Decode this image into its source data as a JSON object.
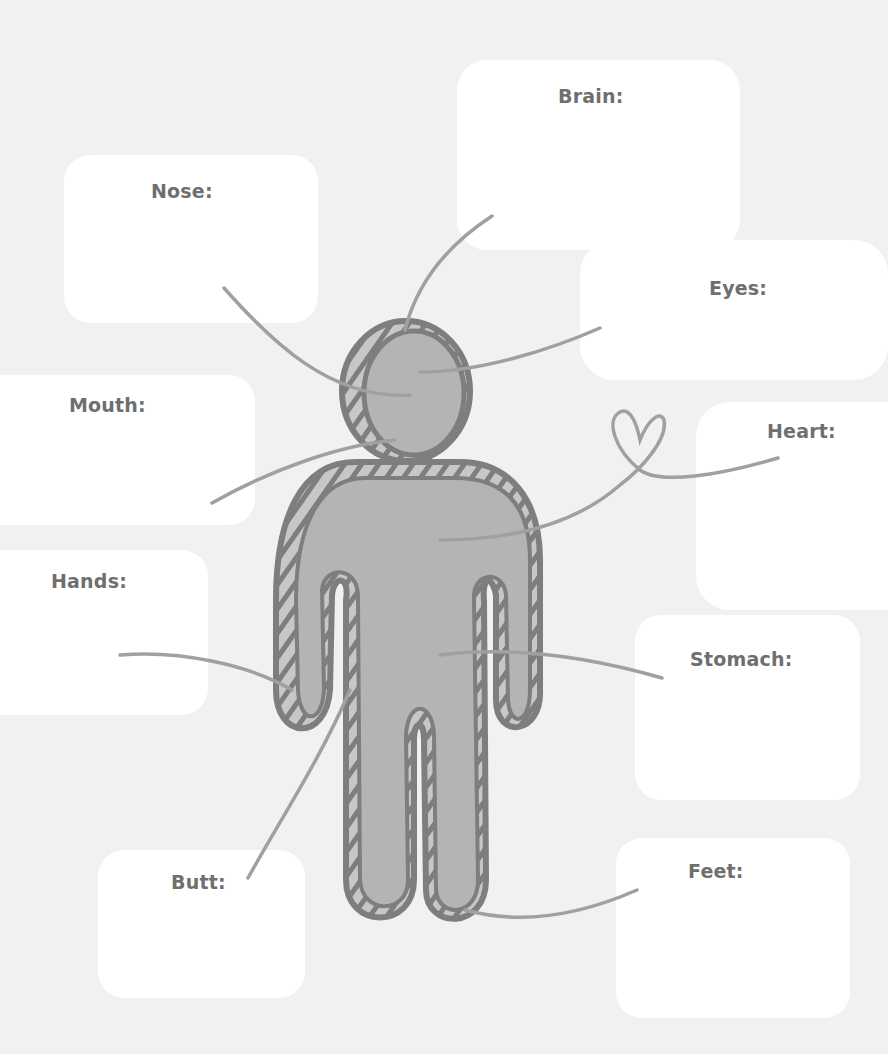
{
  "worksheet": {
    "labels": {
      "brain": "Brain:",
      "nose": "Nose:",
      "eyes": "Eyes:",
      "mouth": "Mouth:",
      "heart": "Heart:",
      "hands": "Hands:",
      "stomach": "Stomach:",
      "butt": "Butt:",
      "feet": "Feet:"
    },
    "colors": {
      "background": "#f1f1f1",
      "box": "#ffffff",
      "figure_fill": "#b4b4b4",
      "figure_outline": "#7e7e7e",
      "lines": "#9e9e9e",
      "label_text": "#6f6f6f"
    }
  }
}
